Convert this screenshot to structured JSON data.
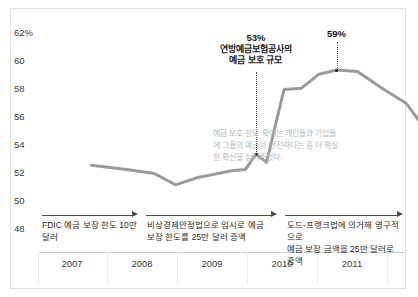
{
  "chart_data": {
    "type": "line",
    "title": "",
    "subtitle": "",
    "xlabel": "",
    "ylabel": "",
    "ylim": [
      48,
      62
    ],
    "yticks": [
      "62%",
      "60",
      "58",
      "56",
      "54",
      "52",
      "50",
      "48"
    ],
    "ytick_values": [
      62,
      60,
      58,
      56,
      54,
      52,
      50,
      48
    ],
    "xticks": [
      "2007",
      "2008",
      "2009",
      "2010",
      "2011"
    ],
    "grid": false,
    "legend_position": "none",
    "series": [
      {
        "name": "FDIC 예금 보호 규모 (%)",
        "color": "#9a9a9a",
        "x": [
          2006.85,
          2007.35,
          2007.75,
          2008.05,
          2008.35,
          2008.65,
          2008.85,
          2009.05,
          2009.2,
          2009.35,
          2009.6,
          2009.85,
          2010.1,
          2010.35,
          2010.65,
          2011.0,
          2011.35,
          2011.7,
          2011.95
        ],
        "values": [
          52.2,
          51.9,
          51.6,
          50.8,
          51.3,
          51.6,
          51.8,
          51.9,
          53.0,
          52.4,
          57.6,
          57.7,
          58.7,
          59.0,
          58.9,
          57.7,
          56.6,
          54.2,
          55.2
        ]
      }
    ],
    "annotations": [
      {
        "id": "annotation-fdic-coverage",
        "value_label": "53%",
        "lines": [
          "연방예금보험공사의",
          "예금 보호 규모"
        ],
        "point_x": 2009.2,
        "point_y": 53.0
      },
      {
        "id": "annotation-peak",
        "value_label": "59%",
        "lines": [],
        "point_x": 2010.35,
        "point_y": 59.0
      }
    ],
    "note_text": "예금 보호 한도 확대는 개인들과 기업들에 그들의 예금이 안전하다는 좀 더 확실한 확신을 심어주었다.",
    "timeline": [
      {
        "id": "timeline-phase-1",
        "lines": [
          "FDIC 예금 보장 한도 10만 달러"
        ]
      },
      {
        "id": "timeline-phase-2",
        "lines": [
          "비상경제안정법으로 임시로 예금",
          "보장 한도를 25만 달러 증액"
        ]
      },
      {
        "id": "timeline-phase-3",
        "lines": [
          "도드-프랭크법에 의거해 영구적으로",
          "예금 보장 금액을 25만 달러로 증액"
        ]
      }
    ],
    "colors": {
      "line": "#9a9a9a",
      "frame": "#e2e2e2",
      "axis": "#cfcfcf",
      "text": "#2b2b2b",
      "note_text": "#b9b9b9",
      "arrow": "#4a4a4a",
      "dot": "#222222"
    }
  }
}
